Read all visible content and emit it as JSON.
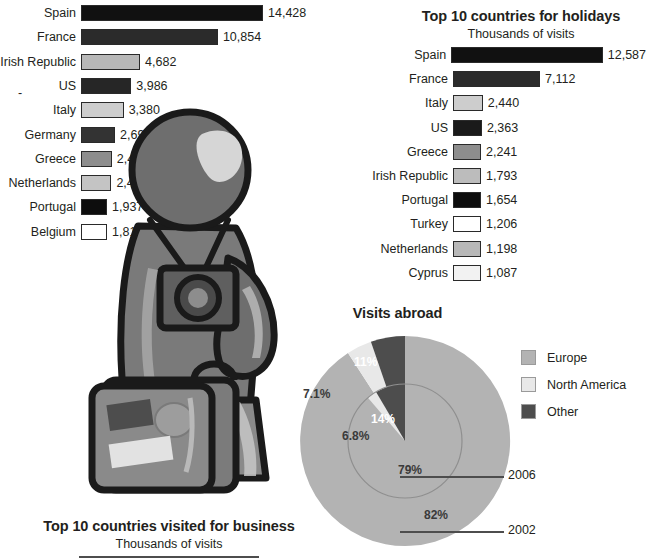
{
  "business_chart": {
    "title": "Top 10 countries visited for business",
    "subtitle": "Thousands of visits",
    "chart_data": {
      "type": "bar",
      "title": "Top 10 countries visited for business",
      "subtitle": "Thousands of visits",
      "xlabel": "Thousands of visits",
      "ylabel": "",
      "orientation": "horizontal",
      "categories": [
        "Spain",
        "France",
        "Irish Republic",
        "US",
        "Italy",
        "Germany",
        "Greece",
        "Netherlands",
        "Portugal",
        "Belgium"
      ],
      "values": [
        14428,
        10854,
        4682,
        3986,
        3380,
        2698,
        2436,
        2410,
        1937,
        1815
      ],
      "value_labels": [
        "14,428",
        "10,854",
        "4,682",
        "3,986",
        "3,380",
        "2,698",
        "2,436",
        "2,410",
        "1,937",
        "1,815"
      ],
      "bar_colors": [
        "#111111",
        "#2b2b2b",
        "#b8b8b8",
        "#262626",
        "#cdcdcd",
        "#333333",
        "#8d8d8d",
        "#c4c4c4",
        "#0d0d0d",
        "#ffffff"
      ],
      "xlim": [
        0,
        14428
      ],
      "grid": false,
      "legend": "none"
    },
    "marker_dash": "-"
  },
  "holiday_chart": {
    "title": "Top 10 countries for holidays",
    "subtitle": "Thousands of visits",
    "chart_data": {
      "type": "bar",
      "title": "Top 10 countries for holidays",
      "subtitle": "Thousands of visits",
      "xlabel": "Thousands of visits",
      "ylabel": "",
      "orientation": "horizontal",
      "categories": [
        "Spain",
        "France",
        "Italy",
        "US",
        "Greece",
        "Irish Republic",
        "Portugal",
        "Turkey",
        "Netherlands",
        "Cyprus"
      ],
      "values": [
        12587,
        7112,
        2440,
        2363,
        2241,
        1793,
        1654,
        1206,
        1198,
        1087
      ],
      "value_labels": [
        "12,587",
        "7,112",
        "2,440",
        "2,363",
        "2,241",
        "1,793",
        "1,654",
        "1,206",
        "1,198",
        "1,087"
      ],
      "bar_colors": [
        "#111111",
        "#2b2b2b",
        "#cdcdcd",
        "#1a1a1a",
        "#8d8d8d",
        "#bcbcbc",
        "#0d0d0d",
        "#ffffff",
        "#b8b8b8",
        "#f2f2f2"
      ],
      "xlim": [
        0,
        12587
      ],
      "grid": false,
      "legend": "none"
    }
  },
  "pie_chart": {
    "title": "Visits abroad",
    "chart_data": {
      "type": "pie",
      "title": "Visits abroad",
      "rings": [
        {
          "name": "2006",
          "ring": "inner",
          "year_label": "2006",
          "labels": [
            "79%",
            "6.8%",
            "14%"
          ],
          "categories": [
            "Europe",
            "North America",
            "Other"
          ],
          "values": [
            79,
            6.8,
            14
          ]
        },
        {
          "name": "2002",
          "ring": "outer",
          "year_label": "2002",
          "labels": [
            "82%",
            "7.1%",
            "11%"
          ],
          "categories": [
            "Europe",
            "North America",
            "Other"
          ],
          "values": [
            82,
            7.1,
            11
          ]
        }
      ],
      "legend": [
        "Europe",
        "North America",
        "Other"
      ],
      "legend_position": "right",
      "colors": {
        "europe": "#b3b3b3",
        "north_america": "#e6e6e6",
        "other": "#4d4d4d"
      }
    },
    "legend": [
      {
        "label": "Europe",
        "color": "#b3b3b3"
      },
      {
        "label": "North America",
        "color": "#e8e8e8"
      },
      {
        "label": "Other",
        "color": "#4d4d4d"
      }
    ],
    "year_2006": "2006",
    "year_2002": "2002",
    "pct_outer_europe": "82%",
    "pct_outer_na": "7.1%",
    "pct_outer_other": "11%",
    "pct_inner_europe": "79%",
    "pct_inner_na": "6.8%",
    "pct_inner_other": "14%"
  },
  "mascot": {
    "name": "tourist-with-camera-and-suitcase"
  }
}
